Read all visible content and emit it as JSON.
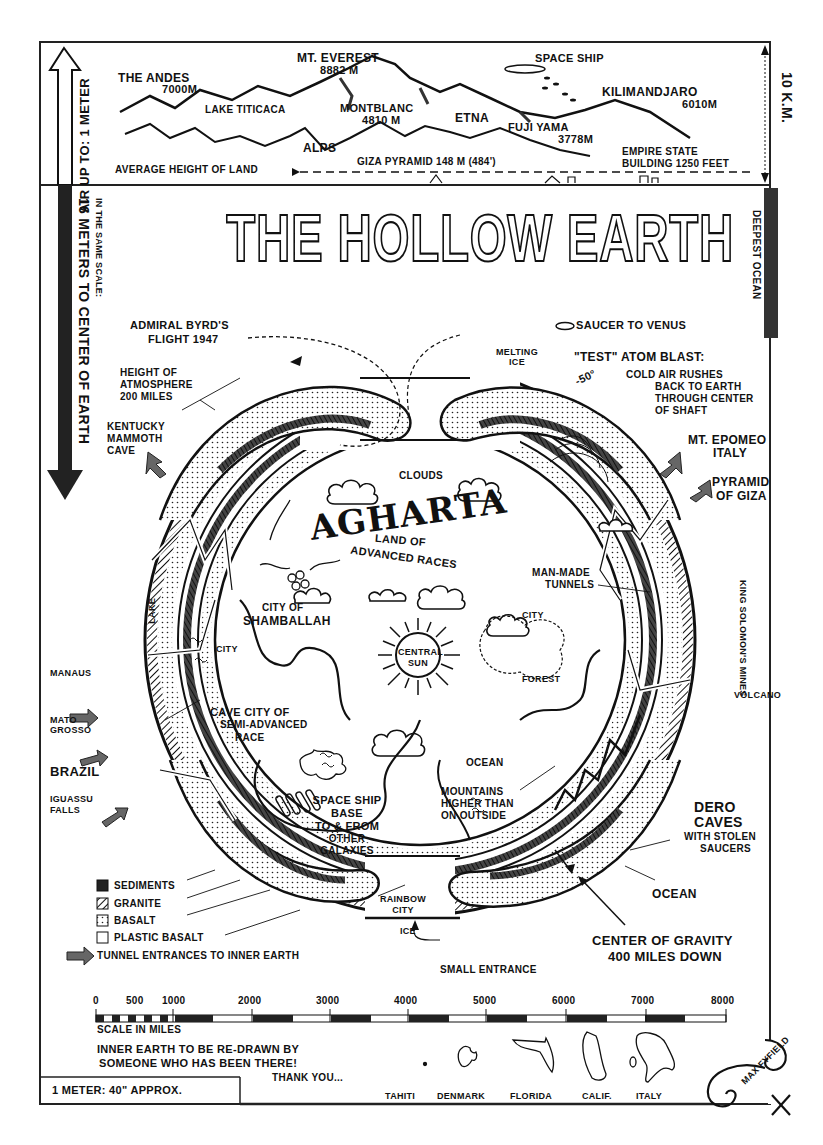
{
  "title": "THE HOLLOW EARTH",
  "top_panel": {
    "left_side": "AIR UP TO: 1 METER",
    "right_side": "10 K.M.",
    "mountains": [
      {
        "name": "THE ANDES",
        "height": "7000m"
      },
      {
        "name": "MT. EVEREST",
        "height": "8882 m"
      },
      {
        "name": "MONTBLANC",
        "height": "4810 m"
      },
      {
        "name": "ETNA",
        "height": ""
      },
      {
        "name": "FUJI YAMA",
        "height": "3778m"
      },
      {
        "name": "KILIMANDJARO",
        "height": "6010m"
      }
    ],
    "lake": "LAKE TITICACA",
    "alps": "ALPS",
    "space_ship": "SPACE SHIP",
    "average_height": "AVERAGE HEIGHT OF LAND",
    "giza": "GIZA PYRAMID 148 m (484')",
    "empire_state_line1": "EMPIRE STATE",
    "empire_state_line2": "BUILDING 1250 FEET"
  },
  "side_notes": {
    "left_scale_small": "IN THE SAME SCALE:",
    "left_scale_big": "16 METERS TO CENTER OF EARTH",
    "right_ocean": "DEEPEST OCEAN"
  },
  "labels": {
    "byrd_line1": "ADMIRAL BYRD'S",
    "byrd_line2": "FLIGHT 1947",
    "atmos_line1": "HEIGHT OF",
    "atmos_line2": "ATMOSPHERE",
    "atmos_line3": "200 MILES",
    "kentucky_line1": "KENTUCKY",
    "kentucky_line2": "MAMMOTH",
    "kentucky_line3": "CAVE",
    "saucer": "SAUCER TO VENUS",
    "melting_line1": "MELTING",
    "melting_line2": "ICE",
    "atom_blast": "\"TEST\" ATOM BLAST:",
    "temp": "-50°",
    "cold_air_line1": "COLD AIR RUSHES",
    "cold_air_line2": "BACK TO EARTH",
    "cold_air_line3": "THROUGH CENTER",
    "cold_air_line4": "OF SHAFT",
    "epomeo_line1": "MT. EPOMEO",
    "epomeo_line2": "ITALY",
    "pyramid_line1": "PYRAMID",
    "pyramid_line2": "OF GIZA",
    "clouds": "CLOUDS",
    "agharta": "AGHARTA",
    "agharta_sub1": "LAND OF",
    "agharta_sub2": "ADVANCED RACES",
    "shamballah_line1": "CITY OF",
    "shamballah_line2": "SHAMBALLAH",
    "city_left": "CITY",
    "city_right": "CITY",
    "lake_inner": "LAKE",
    "central_sun_line1": "CENTRAL",
    "central_sun_line2": "SUN",
    "tunnels_line1": "MAN-MADE",
    "tunnels_line2": "TUNNELS",
    "king_solomon": "KING SOLOMON'S MINES",
    "forest": "FOREST",
    "volcano": "VOLCANO",
    "manaus": "MANAUS",
    "mato_grosso_line1": "MATO",
    "mato_grosso_line2": "GROSSO",
    "brazil": "BRAZIL",
    "iguassu_line1": "IGUASSU",
    "iguassu_line2": "FALLS",
    "cave_city_line1": "CAVE CITY OF",
    "cave_city_line2": "SEMI-ADVANCED",
    "cave_city_line3": "RACE",
    "ocean_inner": "OCEAN",
    "mountains_line1": "MOUNTAINS",
    "mountains_line2": "HIGHER THAN",
    "mountains_line3": "ON OUTSIDE",
    "dero_line1": "DERO",
    "dero_line2": "CAVES",
    "dero_line3": "WITH STOLEN",
    "dero_line4": "SAUCERS",
    "spaceship_base_line1": "SPACE SHIP",
    "spaceship_base_line2": "BASE",
    "spaceship_base_line3": "TO & FROM",
    "spaceship_base_line4": "OTHER",
    "spaceship_base_line5": "GALAXIES",
    "ocean_outer": "OCEAN",
    "rainbow_line1": "RAINBOW",
    "rainbow_line2": "CITY",
    "ice": "ICE",
    "small_entrance": "SMALL ENTRANCE",
    "gravity_line1": "CENTER OF GRAVITY",
    "gravity_line2": "400 MILES DOWN"
  },
  "legend": {
    "items": [
      {
        "label": "SEDIMENTS",
        "pattern": "solid"
      },
      {
        "label": "GRANITE",
        "pattern": "hatched"
      },
      {
        "label": "BASALT",
        "pattern": "dotted"
      },
      {
        "label": "PLASTIC BASALT",
        "pattern": "empty"
      }
    ],
    "arrow_label": "TUNNEL ENTRANCES TO INNER EARTH"
  },
  "scale": {
    "ticks": [
      "0",
      "500",
      "1000",
      "2000",
      "3000",
      "4000",
      "5000",
      "6000",
      "7000",
      "8000"
    ],
    "caption": "SCALE IN MILES"
  },
  "footer": {
    "note_line1": "INNER EARTH TO BE RE-DRAWN BY",
    "note_line2": "SOMEONE WHO HAS BEEN THERE!",
    "thanks": "THANK YOU...",
    "meter_box": "1 METER: 40\" APPROX.",
    "regions": [
      "TAHITI",
      "DENMARK",
      "FLORIDA",
      "CALIF.",
      "ITALY"
    ],
    "signature": "MAX FYFIELD"
  },
  "colors": {
    "ink": "#111111",
    "paper": "#ffffff",
    "shade": "#555555"
  }
}
